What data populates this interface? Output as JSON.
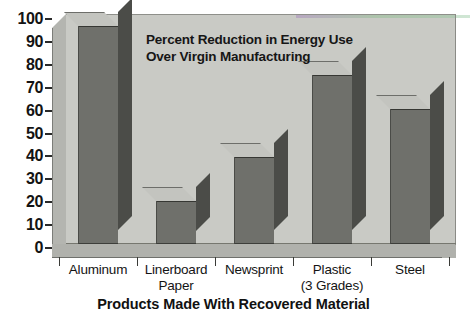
{
  "chart_data": {
    "type": "bar",
    "title": "Percent Reduction in Energy Use Over Virgin Manufacturing",
    "title_lines": [
      "Percent Reduction in Energy Use",
      "Over Virgin Manufacturing"
    ],
    "xlabel": "Products Made With Recovered Material",
    "ylabel": "",
    "ylim": [
      0,
      100
    ],
    "yticks": [
      0,
      10,
      20,
      30,
      40,
      50,
      60,
      70,
      80,
      90,
      100
    ],
    "ytick_labels": [
      "0",
      "10",
      "20",
      "30",
      "40",
      "50",
      "60",
      "70",
      "80",
      "90",
      "100"
    ],
    "grid": false,
    "legend": false,
    "categories": [
      "Aluminum",
      "Linerboard Paper",
      "Newsprint",
      "Plastic (3 Grades)",
      "Steel"
    ],
    "category_label_lines": [
      [
        "Aluminum",
        ""
      ],
      [
        "Linerboard",
        "Paper"
      ],
      [
        "Newsprint",
        ""
      ],
      [
        "Plastic",
        "(3 Grades)"
      ],
      [
        "Steel",
        ""
      ]
    ],
    "values": [
      95,
      19,
      38,
      74,
      59
    ],
    "series": [
      {
        "name": "Percent Reduction in Energy Use",
        "values": [
          95,
          19,
          38,
          74,
          59
        ]
      }
    ],
    "style": "3d-column",
    "colors": {
      "bar_front": "#6f706b",
      "bar_side": "#4b4c48",
      "bar_top": "#c3c4bf",
      "plot_background": "#c9cac5",
      "floor": "#b0b1ac",
      "wall_left": "#b4b5b0",
      "text": "#141414",
      "page_background": "#ffffff"
    }
  },
  "axis": {
    "y_labels": [
      "100",
      "90",
      "80",
      "70",
      "60",
      "50",
      "40",
      "30",
      "20",
      "10",
      "0"
    ],
    "x_caption": "Products Made With Recovered Material"
  },
  "title": {
    "line1": "Percent Reduction in Energy Use",
    "line2": "Over Virgin Manufacturing"
  },
  "categories": [
    {
      "line1": "Aluminum",
      "line2": ""
    },
    {
      "line1": "Linerboard",
      "line2": "Paper"
    },
    {
      "line1": "Newsprint",
      "line2": ""
    },
    {
      "line1": "Plastic",
      "line2": "(3 Grades)"
    },
    {
      "line1": "Steel",
      "line2": ""
    }
  ]
}
